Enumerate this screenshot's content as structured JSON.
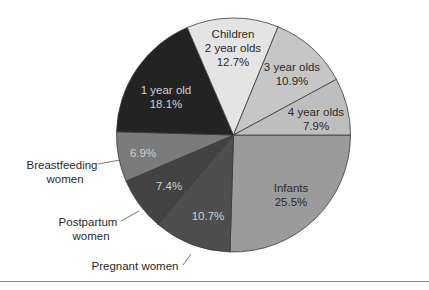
{
  "chart_data": {
    "type": "pie",
    "title": "",
    "start_angle_deg": 0,
    "direction": "clockwise",
    "center": [
      233.5,
      135
    ],
    "radius": 117,
    "slices": [
      {
        "key": "infants",
        "label": "Infants",
        "value": 25.5,
        "value_label": "25.5%",
        "color": "#9b9b9b",
        "text_color": "#2a2a2a",
        "label_inside": true,
        "label_pos": [
          265,
          193
        ],
        "line2_pos": [
          265,
          209
        ]
      },
      {
        "key": "pregnant",
        "label": "Pregnant women",
        "value": 10.7,
        "value_label": "10.7%",
        "color": "#4e4e4e",
        "text_color": "#d8d8d8",
        "label_inside": false,
        "pct_pos": [
          208,
          219
        ],
        "ext_label_pos": [
          135,
          269
        ],
        "leader": [
          [
            183,
            264
          ],
          [
            191,
            254
          ]
        ]
      },
      {
        "key": "postpartum",
        "label": "Postpartum women",
        "value": 7.4,
        "value_label": "7.4%",
        "color": "#434343",
        "text_color": "#d8d8d8",
        "label_inside": false,
        "pct_pos": [
          169,
          190
        ],
        "ext_label_pos": [
          87,
          219
        ],
        "line2": "women",
        "line2_pos": [
          92,
          236
        ],
        "leader": [
          [
            121,
            220
          ],
          [
            140,
            211
          ]
        ]
      },
      {
        "key": "breastfeeding",
        "label": "Breastfeeding women",
        "value": 6.9,
        "value_label": "6.9%",
        "color": "#7b7b7b",
        "text_color": "#d0d0d0",
        "label_inside": false,
        "pct_pos": [
          143,
          157
        ],
        "ext_label_pos": [
          66,
          169
        ],
        "line2": "women",
        "line2_pos": [
          71,
          186
        ],
        "leader": [
          [
            98,
            164
          ],
          [
            120,
            160
          ]
        ]
      },
      {
        "key": "one_year",
        "label": "1 year old",
        "value": 18.1,
        "value_label": "18.1%",
        "color": "#232323",
        "text_color": "#cfcfcf",
        "label_inside": true,
        "label_pos": [
          166,
          94
        ],
        "line2_pos": [
          166,
          110
        ]
      },
      {
        "key": "two_year",
        "label": "2 year olds",
        "group": "Children",
        "value": 12.7,
        "value_label": "12.7%",
        "color": "#e4e4e4",
        "text_color": "#2a2a2a",
        "label_inside": true,
        "group_pos": [
          233,
          38
        ],
        "label_pos": [
          233,
          52
        ],
        "line2_pos": [
          233,
          66
        ]
      },
      {
        "key": "three_year",
        "label": "3 year olds",
        "value": 10.9,
        "value_label": "10.9%",
        "color": "#c6c6c6",
        "text_color": "#2a2a2a",
        "label_inside": true,
        "label_pos": [
          292,
          70
        ],
        "line2_pos": [
          292,
          85
        ]
      },
      {
        "key": "four_year",
        "label": "4 year olds",
        "value": 7.9,
        "value_label": "7.9%",
        "color": "#bebebe",
        "text_color": "#2a2a2a",
        "label_inside": true,
        "label_pos": [
          316,
          116
        ],
        "line2_pos": [
          316,
          131
        ]
      }
    ],
    "legend": null,
    "annotations": [
      "Children"
    ]
  },
  "labels": {
    "infants_name": "Infants",
    "infants_pct": "25.5%",
    "pregnant_name": "Pregnant women",
    "pregnant_pct": "10.7%",
    "postpartum_name_1": "Postpartum",
    "postpartum_name_2": "women",
    "postpartum_pct": "7.4%",
    "breastfeeding_name_1": "Breastfeeding",
    "breastfeeding_name_2": "women",
    "breastfeeding_pct": "6.9%",
    "one_year_name": "1 year old",
    "one_year_pct": "18.1%",
    "children_group": "Children",
    "two_year_name": "2 year olds",
    "two_year_pct": "12.7%",
    "three_year_name": "3 year olds",
    "three_year_pct": "10.9%",
    "four_year_name": "4 year olds",
    "four_year_pct": "7.9%"
  }
}
